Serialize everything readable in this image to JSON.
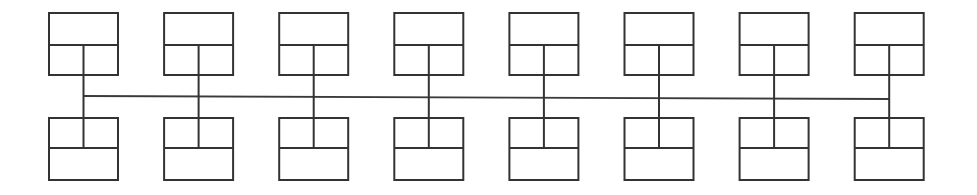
{
  "diagram": {
    "type": "block-diagram",
    "canvas": {
      "width": 977,
      "height": 195,
      "background": "#ffffff"
    },
    "style": {
      "line_color": "#333333",
      "bus_color": "#3a3a3a",
      "box_fill": "#ffffff",
      "stroke_width": 2
    },
    "geometry": {
      "unit_count": 8,
      "first_unit_left": 49,
      "unit_pitch": 115.1,
      "box_width": 69,
      "top_box_top": 13,
      "top_box_divider_y": 45,
      "top_box_bottom": 75,
      "bottom_box_top": 118,
      "bottom_box_divider_y": 148,
      "bottom_box_bottom": 180,
      "bus_y_left": 96,
      "bus_y_right": 99
    },
    "bus": {
      "label": "horizontal bus line",
      "start_unit": 1,
      "end_unit": 8
    },
    "units": [
      {
        "index": 1,
        "label": "unit-1",
        "center_x": 83.5
      },
      {
        "index": 2,
        "label": "unit-2",
        "center_x": 198.6
      },
      {
        "index": 3,
        "label": "unit-3",
        "center_x": 313.7
      },
      {
        "index": 4,
        "label": "unit-4",
        "center_x": 428.8
      },
      {
        "index": 5,
        "label": "unit-5",
        "center_x": 543.9
      },
      {
        "index": 6,
        "label": "unit-6",
        "center_x": 659.0
      },
      {
        "index": 7,
        "label": "unit-7",
        "center_x": 774.1
      },
      {
        "index": 8,
        "label": "unit-8",
        "center_x": 889.2
      }
    ]
  }
}
